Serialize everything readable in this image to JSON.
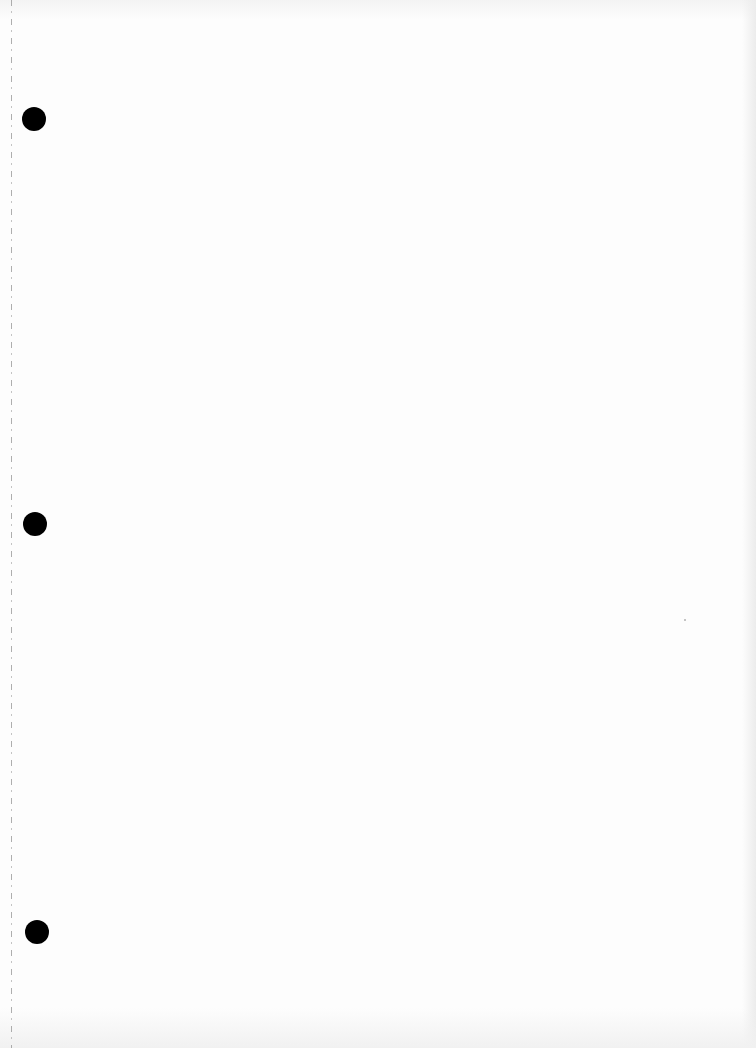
{
  "document": {
    "type": "blank scanned page",
    "text_content": "",
    "background_color": "#fdfdfd",
    "punch_holes": [
      {
        "x": 34,
        "y": 119,
        "diameter": 24,
        "color": "#000000"
      },
      {
        "x": 35,
        "y": 524,
        "diameter": 24,
        "color": "#000000"
      },
      {
        "x": 37,
        "y": 932,
        "diameter": 24,
        "color": "#000000"
      }
    ],
    "margin_line": {
      "x": 11,
      "style": "dashed",
      "color": "#9a9a9a"
    }
  }
}
